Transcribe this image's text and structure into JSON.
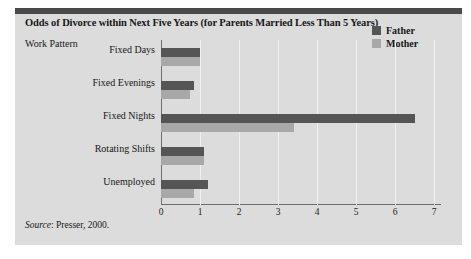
{
  "figure": {
    "title": "Odds of Divorce within Next Five Years (for Parents Married Less Than 5 Years)",
    "axis_title": "Work Pattern",
    "source_label": "Source",
    "source_text": ": Presser, 2000."
  },
  "colors": {
    "father": "#555555",
    "mother": "#a8a8a8",
    "panel": "#dcdcdc",
    "rule": "#4a4a4a"
  },
  "chart_data": {
    "type": "bar",
    "orientation": "horizontal",
    "title": "Odds of Divorce within Next Five Years (for Parents Married Less Than 5 Years)",
    "xlabel": "",
    "ylabel": "Work Pattern",
    "categories": [
      "Fixed Days",
      "Fixed Evenings",
      "Fixed Nights",
      "Rotating Shifts",
      "Unemployed"
    ],
    "series": [
      {
        "name": "Father",
        "values": [
          1.0,
          0.85,
          6.5,
          1.1,
          1.2
        ]
      },
      {
        "name": "Mother",
        "values": [
          1.0,
          0.75,
          3.4,
          1.1,
          0.85
        ]
      }
    ],
    "xlim": [
      0,
      7
    ],
    "xticks": [
      "0",
      "1",
      "2",
      "3",
      "4",
      "5",
      "6",
      "7"
    ],
    "grid": true,
    "legend_position": "top-right"
  }
}
